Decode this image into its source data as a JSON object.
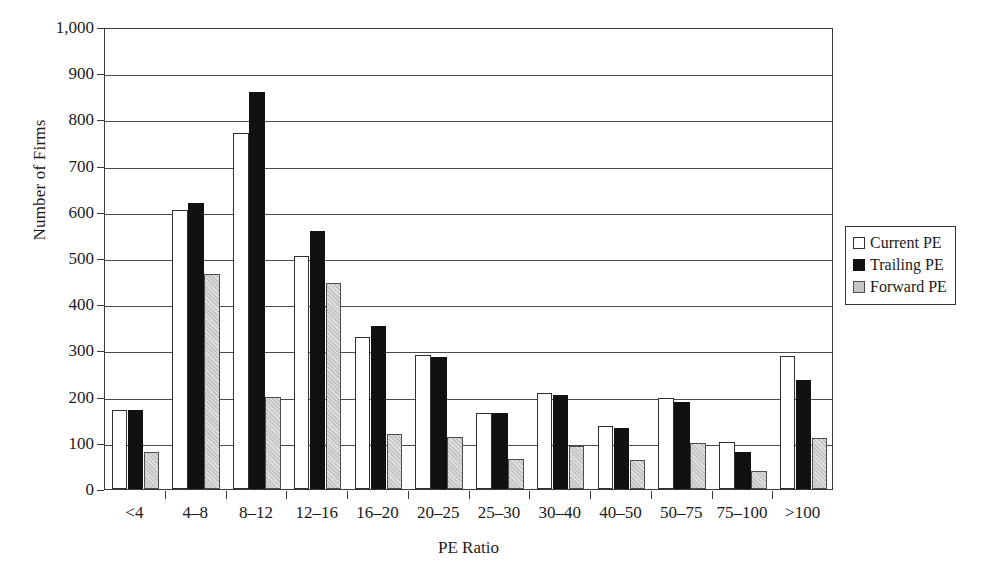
{
  "chart_data": {
    "type": "bar",
    "title": "",
    "xlabel": "PE Ratio",
    "ylabel": "Number of Firms",
    "ylim": [
      0,
      1000
    ],
    "ytick_labels": [
      "1,000",
      "900",
      "800",
      "700",
      "600",
      "500",
      "400",
      "300",
      "200",
      "100",
      "0"
    ],
    "ytick_values": [
      1000,
      900,
      800,
      700,
      600,
      500,
      400,
      300,
      200,
      100,
      0
    ],
    "grid": true,
    "legend_position": "right",
    "categories": [
      "<4",
      "4–8",
      "8–12",
      "12–16",
      "16–20",
      "20–25",
      "25–30",
      "30–40",
      "40–50",
      "50–75",
      "75–100",
      ">100"
    ],
    "series": [
      {
        "name": "Current PE",
        "color": "#ffffff",
        "values": [
          170,
          605,
          770,
          505,
          328,
          290,
          165,
          208,
          136,
          198,
          102,
          288
        ]
      },
      {
        "name": "Trailing PE",
        "color": "#111111",
        "values": [
          172,
          620,
          860,
          558,
          352,
          285,
          164,
          204,
          131,
          188,
          81,
          237
        ]
      },
      {
        "name": "Forward PE",
        "color": "#c6c6c6",
        "values": [
          80,
          465,
          200,
          447,
          118,
          112,
          64,
          94,
          62,
          99,
          38,
          111
        ]
      }
    ]
  }
}
